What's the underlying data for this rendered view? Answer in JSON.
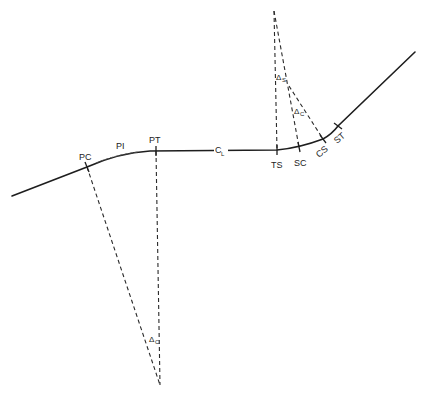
{
  "diagram": {
    "title": "",
    "stroke_color": "#1e1e1e",
    "background": "#ffffff"
  },
  "labels": {
    "pc": "PC",
    "pi": "PI",
    "pt": "PT",
    "centerline": "C",
    "centerline_sub": "L",
    "ts": "TS",
    "sc": "SC",
    "cs": "CS",
    "st": "ST",
    "delta_s": "Δ",
    "delta_s_sub": "S",
    "delta_c_upper": "Δ",
    "delta_c_upper_sub": "C",
    "delta_c_lower": "Δ",
    "delta_c_lower_sub": "C"
  },
  "points": {
    "PC": [
      87,
      167
    ],
    "PI": [
      120,
      152
    ],
    "PT": [
      156,
      151
    ],
    "TS": [
      277,
      150
    ],
    "SC": [
      299,
      147
    ],
    "CS": [
      323,
      139
    ],
    "ST": [
      338,
      126
    ],
    "simple_curve_center": [
      160,
      385
    ],
    "spiral_apex": [
      274,
      11
    ],
    "spiral_branch": [
      289,
      86
    ]
  }
}
